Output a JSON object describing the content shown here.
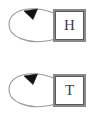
{
  "diagram": {
    "type": "state-transition-diagram",
    "background_color": "#ffffff",
    "states": [
      {
        "id": "h",
        "label": "H",
        "shape": "double-square",
        "box_border_color": "#8a8a8a",
        "box_inner_border_color": "#5a5a5a",
        "label_color": "#3d3d3d",
        "self_loop": {
          "present": true,
          "side": "left",
          "stroke_color": "#9a9a9a",
          "arrowhead_color": "#111111",
          "arrowhead_direction": "down-left"
        }
      },
      {
        "id": "t",
        "label": "T",
        "shape": "double-square",
        "box_border_color": "#8a8a8a",
        "box_inner_border_color": "#5a5a5a",
        "label_color": "#3d3d3d",
        "self_loop": {
          "present": true,
          "side": "left",
          "stroke_color": "#9a9a9a",
          "arrowhead_color": "#111111",
          "arrowhead_direction": "down-left"
        }
      }
    ]
  }
}
